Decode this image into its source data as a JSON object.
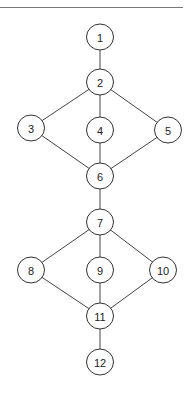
{
  "diagram": {
    "type": "graph",
    "top_rule": {
      "x1": 0,
      "x2": 183,
      "y": 7
    },
    "node_radius": 13.5,
    "colors": {
      "line": "#444444",
      "node_stroke": "#333333",
      "node_fill": "#ffffff",
      "text": "#222222"
    },
    "nodes": [
      {
        "id": "1",
        "label": "1",
        "x": 100,
        "y": 37
      },
      {
        "id": "2",
        "label": "2",
        "x": 100,
        "y": 82
      },
      {
        "id": "3",
        "label": "3",
        "x": 31,
        "y": 128
      },
      {
        "id": "4",
        "label": "4",
        "x": 100,
        "y": 130
      },
      {
        "id": "5",
        "label": "5",
        "x": 168,
        "y": 130
      },
      {
        "id": "6",
        "label": "6",
        "x": 100,
        "y": 176
      },
      {
        "id": "7",
        "label": "7",
        "x": 100,
        "y": 222
      },
      {
        "id": "8",
        "label": "8",
        "x": 31,
        "y": 270
      },
      {
        "id": "9",
        "label": "9",
        "x": 100,
        "y": 270
      },
      {
        "id": "10",
        "label": "10",
        "x": 163,
        "y": 270
      },
      {
        "id": "11",
        "label": "11",
        "x": 100,
        "y": 316
      },
      {
        "id": "12",
        "label": "12",
        "x": 100,
        "y": 362
      }
    ],
    "edges": [
      [
        "1",
        "2"
      ],
      [
        "2",
        "3"
      ],
      [
        "2",
        "4"
      ],
      [
        "2",
        "5"
      ],
      [
        "3",
        "6"
      ],
      [
        "4",
        "6"
      ],
      [
        "5",
        "6"
      ],
      [
        "6",
        "7"
      ],
      [
        "7",
        "8"
      ],
      [
        "7",
        "9"
      ],
      [
        "7",
        "10"
      ],
      [
        "8",
        "11"
      ],
      [
        "9",
        "11"
      ],
      [
        "10",
        "11"
      ],
      [
        "11",
        "12"
      ]
    ]
  }
}
